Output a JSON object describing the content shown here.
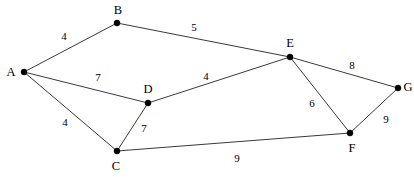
{
  "diagram": {
    "width": 414,
    "height": 177,
    "background_color": "#ffffff",
    "edge_color": "#3a3a3a",
    "node_color": "#000000",
    "nodes": [
      {
        "id": "A",
        "label": "A",
        "x": 24,
        "y": 72,
        "label_x": 11,
        "label_y": 72
      },
      {
        "id": "B",
        "label": "B",
        "x": 117,
        "y": 23,
        "label_x": 118,
        "label_y": 10
      },
      {
        "id": "C",
        "label": "C",
        "x": 117,
        "y": 151,
        "label_x": 116,
        "label_y": 166
      },
      {
        "id": "D",
        "label": "D",
        "x": 148,
        "y": 103,
        "label_x": 148,
        "label_y": 89
      },
      {
        "id": "E",
        "label": "E",
        "x": 290,
        "y": 57,
        "label_x": 290,
        "label_y": 43
      },
      {
        "id": "F",
        "label": "F",
        "x": 350,
        "y": 133,
        "label_x": 352,
        "label_y": 148
      },
      {
        "id": "G",
        "label": "G",
        "x": 398,
        "y": 88,
        "label_x": 408,
        "label_y": 87
      }
    ],
    "edges": [
      {
        "from": "A",
        "to": "B",
        "weight": "4",
        "label_x": 64,
        "label_y": 36
      },
      {
        "from": "B",
        "to": "E",
        "weight": "5",
        "label_x": 194,
        "label_y": 27
      },
      {
        "from": "A",
        "to": "D",
        "weight": "7",
        "label_x": 98,
        "label_y": 77
      },
      {
        "from": "D",
        "to": "E",
        "weight": "4",
        "label_x": 206,
        "label_y": 76
      },
      {
        "from": "A",
        "to": "C",
        "weight": "4",
        "label_x": 65,
        "label_y": 122
      },
      {
        "from": "C",
        "to": "D",
        "weight": "7",
        "label_x": 144,
        "label_y": 128
      },
      {
        "from": "C",
        "to": "F",
        "weight": "9",
        "label_x": 237,
        "label_y": 158
      },
      {
        "from": "E",
        "to": "F",
        "weight": "6",
        "label_x": 312,
        "label_y": 103
      },
      {
        "from": "E",
        "to": "G",
        "weight": "8",
        "label_x": 352,
        "label_y": 65
      },
      {
        "from": "F",
        "to": "G",
        "weight": "9",
        "label_x": 386,
        "label_y": 119
      }
    ]
  }
}
